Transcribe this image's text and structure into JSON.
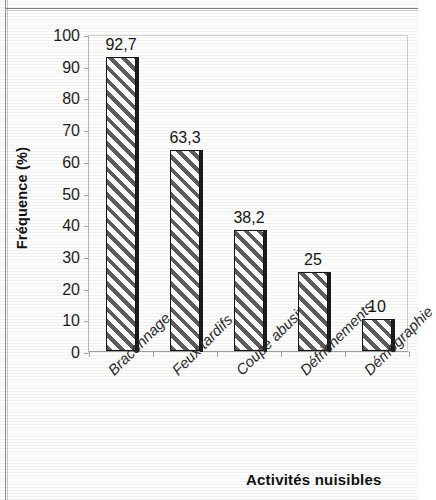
{
  "chart_data": {
    "type": "bar",
    "title": "",
    "xlabel": "Activités nuisibles",
    "ylabel": "Fréquence (%)",
    "categories": [
      "Braconnage",
      "Feux tardifs",
      "Coupe abusive",
      "Défrichements",
      "Démographie"
    ],
    "values": [
      92.7,
      63.3,
      38.2,
      25,
      10
    ],
    "value_labels": [
      "92,7",
      "63,3",
      "38,2",
      "25",
      "10"
    ],
    "ylim": [
      0,
      100
    ],
    "yticks": [
      0,
      10,
      20,
      30,
      40,
      50,
      60,
      70,
      80,
      90,
      100
    ],
    "ytick_labels": [
      "0",
      "10",
      "20",
      "30",
      "40",
      "50",
      "60",
      "70",
      "80",
      "90",
      "100"
    ],
    "grid": false,
    "legend": "none",
    "series": [
      {
        "name": "Fréquence",
        "values": [
          92.7,
          63.3,
          38.2,
          25,
          10
        ],
        "fill": "diagonal-hatch",
        "fill_color": "#5d5d5d",
        "edge_color": "#141414"
      }
    ]
  },
  "axes": {
    "y_title": "Fréquence (%)",
    "x_title": "Activités nuisibles"
  },
  "colors": {
    "hatch": "#5d5d5d",
    "bar_edge": "#141414",
    "axis_line": "#a8a8a8",
    "plot_border": "#cfcfcf",
    "text": "#1a1a1a",
    "page_frame": "#8d8d8d"
  }
}
